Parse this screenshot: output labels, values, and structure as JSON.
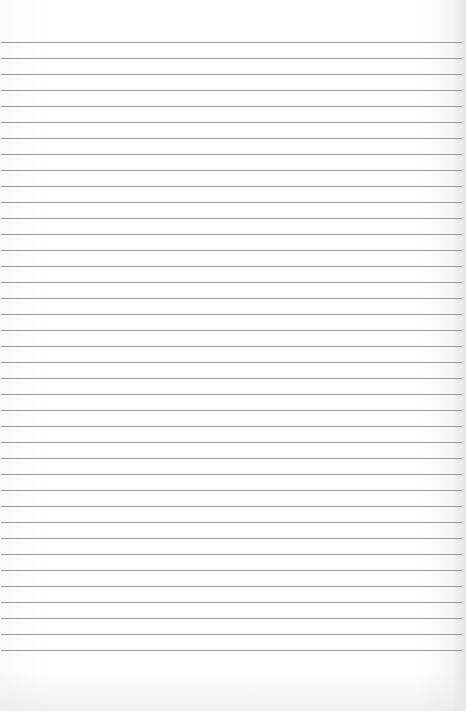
{
  "page": {
    "type": "lined-paper",
    "background_color": "#ffffff",
    "line_color": "#9a9a9a",
    "first_line_y": 42,
    "line_spacing": 16,
    "line_count": 39
  }
}
